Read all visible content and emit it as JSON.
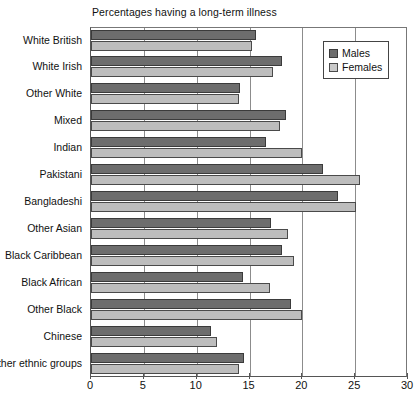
{
  "chart_data": {
    "type": "bar",
    "orientation": "horizontal",
    "title": "Percentages having a long-term illness",
    "xlabel": "",
    "ylabel": "",
    "xlim": [
      0,
      30
    ],
    "xticks": [
      0,
      5,
      10,
      15,
      20,
      25,
      30
    ],
    "grid": true,
    "legend_position": "top-right",
    "categories": [
      "White British",
      "White Irish",
      "Other White",
      "Mixed",
      "Indian",
      "Pakistani",
      "Bangladeshi",
      "Other Asian",
      "Black Caribbean",
      "Black African",
      "Other Black",
      "Chinese",
      "Other ethnic groups"
    ],
    "series": [
      {
        "name": "Males",
        "color": "#6d6d6d",
        "values": [
          15.6,
          18.1,
          14.1,
          18.5,
          16.6,
          22.0,
          23.4,
          17.0,
          18.1,
          14.4,
          18.9,
          11.4,
          14.5
        ]
      },
      {
        "name": "Females",
        "color": "#bdbdbd",
        "values": [
          15.2,
          17.2,
          14.0,
          17.9,
          20.0,
          25.5,
          25.1,
          18.6,
          19.2,
          16.9,
          20.0,
          11.9,
          14.0
        ]
      }
    ]
  },
  "legend": {
    "items": [
      {
        "label": "Males"
      },
      {
        "label": "Females"
      }
    ]
  }
}
